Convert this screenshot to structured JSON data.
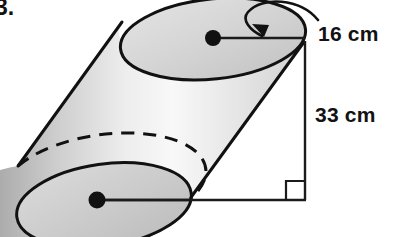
{
  "figure": {
    "item_number": "3.",
    "shape_name": "oblique-cylinder",
    "labels": {
      "radius": "16 cm",
      "height": "33 cm"
    },
    "colors": {
      "outline": "#111111",
      "body_shade_dark": "#9a9a9a",
      "body_shade_light": "#fbfbfb",
      "top_face": "#d8d8d8",
      "bottom_face": "#cfcfcf",
      "text": "#121212"
    },
    "annotations": {
      "radius_leader": "curved-arrow",
      "right_angle": "right-angle-marker",
      "hidden_edge": "dashed-back-ellipse"
    },
    "measurements": {
      "radius_cm": 16,
      "height_cm": 33
    }
  }
}
